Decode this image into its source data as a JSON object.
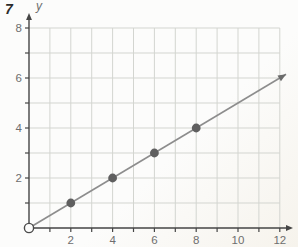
{
  "problem_number": "7",
  "chart_data": {
    "type": "scatter",
    "title": "",
    "xlabel": "",
    "ylabel": "y",
    "xlim": [
      0,
      12
    ],
    "ylim": [
      0,
      8
    ],
    "grid": true,
    "x_tick_step": 1,
    "y_tick_step": 1,
    "x_tick_labels": [
      2,
      4,
      6,
      8,
      10,
      12
    ],
    "y_tick_labels": [
      2,
      4,
      6,
      8
    ],
    "points": [
      [
        2,
        1
      ],
      [
        4,
        2
      ],
      [
        6,
        3
      ],
      [
        8,
        4
      ]
    ],
    "origin_open_point": [
      0,
      0
    ],
    "ray": {
      "from": [
        0,
        0
      ],
      "to": [
        12.3,
        6.15
      ],
      "arrow": true
    },
    "axis_arrows": {
      "x": true,
      "y": true
    },
    "colors": {
      "background": "#fbfaf7",
      "grid": "#d3d5d0",
      "axis": "#454545",
      "ray": "#8d8d8d",
      "point_fill": "#5f5f5f",
      "open_point_stroke": "#4a4a4a",
      "open_point_fill": "#fcfcfb",
      "tick_label": "#6e6e6e",
      "axis_label": "#6e6e6e",
      "problem_number": "#2b2b2b"
    }
  }
}
